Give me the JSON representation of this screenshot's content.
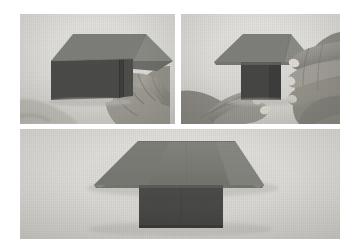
{
  "page": {
    "background_color": "#ffffff",
    "width": 358,
    "height": 250,
    "photo_count": 3,
    "color_mode": "grayscale"
  },
  "palette": {
    "photo_background": "#dcdbd7",
    "paper_light_gray": "#7d7d79",
    "paper_mid_gray": "#6f6f6c",
    "paper_dark_gray": "#4a4a48",
    "paper_darkest": "#3e3e3c",
    "skin": "#9b9992",
    "skin_shadow": "#76746e",
    "nail_highlight": "#d8d6cf",
    "border_white": "#ffffff"
  },
  "panels": [
    {
      "id": "panel-top-left",
      "name": "step-1-photo",
      "position": "top-left",
      "caption": "Folded paper model held at right edge by fingers; upper triangular flap angles down to the right over a dark rectangular body",
      "subject": "origami paper model",
      "hands_visible": true,
      "hand_count": 1,
      "model_parts": [
        "triangular-flap",
        "rectangular-body",
        "vertical-crease"
      ]
    },
    {
      "id": "panel-top-right",
      "name": "step-2-photo",
      "position": "top-right",
      "caption": "Two hands press both sides of the model; roof-shaped flap sits above a narrow dark vertical body",
      "subject": "origami paper model",
      "hands_visible": true,
      "hand_count": 2,
      "model_parts": [
        "roof-flap",
        "narrow-dark-body"
      ]
    },
    {
      "id": "panel-bottom",
      "name": "step-3-photo",
      "position": "bottom",
      "caption": "Finished symmetrical model resting on surface: wide trapezoidal roof above a dark rectangular base, no hands",
      "subject": "completed origami model",
      "hands_visible": false,
      "hand_count": 0,
      "model_parts": [
        "trapezoidal-roof",
        "rectangular-base",
        "cast-shadow"
      ]
    }
  ]
}
